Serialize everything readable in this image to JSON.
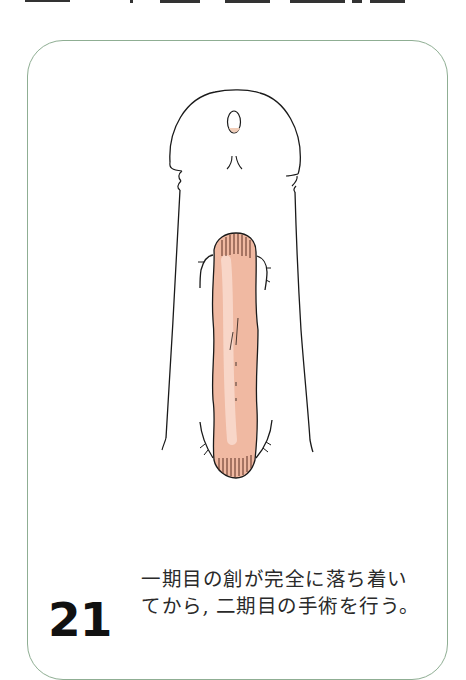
{
  "figure": {
    "number": "21",
    "caption_lines": [
      "一期目の創が完全に落ち着い",
      "てから, 二期目の手術を行う。"
    ]
  },
  "colors": {
    "frame_border": "#8fae93",
    "wound_fill": "#f0b9a2",
    "outline": "#1a1a1a"
  }
}
